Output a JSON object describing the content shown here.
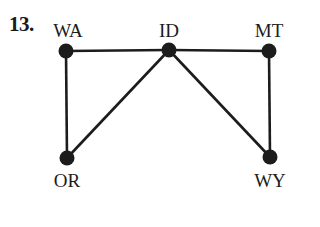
{
  "problem": {
    "number": "13."
  },
  "colors": {
    "ink": "#1c1c1c",
    "background": "#ffffff"
  },
  "graph": {
    "nodes": [
      {
        "id": "WA",
        "label": "WA",
        "x": 66,
        "y": 51,
        "label_x": 68,
        "label_y": 20,
        "label_pos": "above"
      },
      {
        "id": "ID",
        "label": "ID",
        "x": 169,
        "y": 50,
        "label_x": 169,
        "label_y": 20,
        "label_pos": "above"
      },
      {
        "id": "MT",
        "label": "MT",
        "x": 269,
        "y": 51,
        "label_x": 269,
        "label_y": 20,
        "label_pos": "above"
      },
      {
        "id": "OR",
        "label": "OR",
        "x": 67,
        "y": 158,
        "label_x": 67,
        "label_y": 170,
        "label_pos": "below"
      },
      {
        "id": "WY",
        "label": "WY",
        "x": 270,
        "y": 157,
        "label_x": 270,
        "label_y": 170,
        "label_pos": "below"
      }
    ],
    "edges": [
      {
        "from": "WA",
        "to": "ID"
      },
      {
        "from": "ID",
        "to": "MT"
      },
      {
        "from": "WA",
        "to": "OR"
      },
      {
        "from": "ID",
        "to": "OR"
      },
      {
        "from": "ID",
        "to": "WY"
      },
      {
        "from": "MT",
        "to": "WY"
      }
    ]
  }
}
